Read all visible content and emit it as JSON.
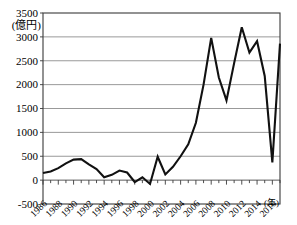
{
  "chart_data": {
    "type": "line",
    "title": "",
    "subtitle": "",
    "xlabel": "(年)",
    "ylabel": "(億円)",
    "unit_label": "(億円)",
    "xaxis_unit_label": "(年)",
    "ylim": [
      -500,
      3500
    ],
    "ytick_step": 500,
    "ytick_labels": [
      "3500",
      "3000",
      "2500",
      "2000",
      "1500",
      "1000",
      "500",
      "0",
      "-500"
    ],
    "ytick_values": [
      3500,
      3000,
      2500,
      2000,
      1500,
      1000,
      500,
      0,
      -500
    ],
    "xlim": [
      1986,
      2017
    ],
    "xtick_labels": [
      "1986",
      "1988",
      "1990",
      "1992",
      "1994",
      "1996",
      "1998",
      "2000",
      "2002",
      "2004",
      "2006",
      "2008",
      "2010",
      "2012",
      "2014",
      "2016"
    ],
    "xtick_values": [
      1986,
      1988,
      1990,
      1992,
      1994,
      1996,
      1998,
      2000,
      2002,
      2004,
      2006,
      2008,
      2010,
      2012,
      2014,
      2016
    ],
    "xtick_label_rotation_deg": -45,
    "grid": true,
    "grid_axis": "y",
    "legend": false,
    "legend_position": "none",
    "line_color": "#111111",
    "grid_color": "#8d8d8d",
    "frame_color": "#3a3a3a",
    "background_color": "#ffffff",
    "x": [
      1986,
      1987,
      1988,
      1989,
      1990,
      1991,
      1992,
      1993,
      1994,
      1995,
      1996,
      1997,
      1998,
      1999,
      2000,
      2001,
      2002,
      2003,
      2004,
      2005,
      2006,
      2007,
      2008,
      2009,
      2010,
      2011,
      2012,
      2013,
      2014,
      2015,
      2016,
      2017
    ],
    "values": [
      150,
      180,
      250,
      350,
      430,
      440,
      330,
      230,
      60,
      110,
      200,
      160,
      -40,
      60,
      -80,
      490,
      120,
      280,
      500,
      750,
      1200,
      2000,
      2980,
      2150,
      1670,
      2450,
      3200,
      2670,
      2910,
      2180,
      370,
      2860
    ],
    "series": [
      {
        "name": "",
        "values": [
          150,
          180,
          250,
          350,
          430,
          440,
          330,
          230,
          60,
          110,
          200,
          160,
          -40,
          60,
          -80,
          490,
          120,
          280,
          500,
          750,
          1200,
          2000,
          2980,
          2150,
          1670,
          2450,
          3200,
          2670,
          2910,
          2180,
          370,
          2860
        ]
      }
    ],
    "annotations": []
  }
}
